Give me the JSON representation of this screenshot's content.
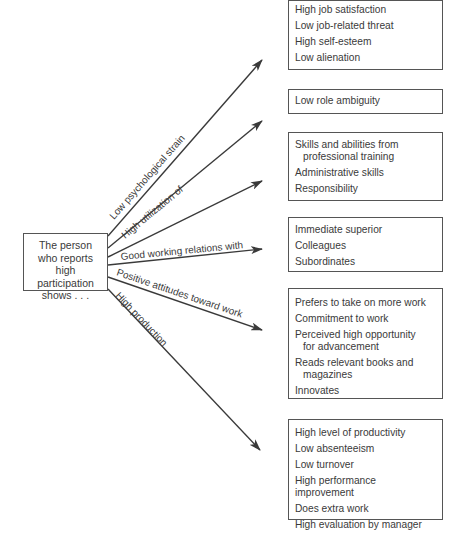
{
  "source": {
    "text": "The person who reports high participation shows . . ."
  },
  "arrows": [
    {
      "label": "Low psychological strain"
    },
    {
      "label": "High utilization of"
    },
    {
      "label": "Good working relations with"
    },
    {
      "label": "Positive attitudes toward work"
    },
    {
      "label": "High production"
    }
  ],
  "boxes": [
    {
      "items": [
        "High job satisfaction",
        "Low job-related threat",
        "High self-esteem",
        "Low alienation"
      ]
    },
    {
      "items": [
        "Low role ambiguity"
      ]
    },
    {
      "items": [
        "Skills and abilities from",
        "Administrative skills",
        "Responsibility"
      ],
      "continuation": {
        "0": "professional training"
      }
    },
    {
      "items": [
        "Immediate superior",
        "Colleagues",
        "Subordinates"
      ]
    },
    {
      "items": [
        "Prefers to take on more work",
        "Commitment to work",
        "Perceived high opportunity",
        "Reads relevant books and",
        "Innovates"
      ],
      "continuation": {
        "2": "for advancement",
        "3": "magazines"
      }
    },
    {
      "items": [
        "High level of productivity",
        "Low absenteeism",
        "Low turnover",
        "High performance improvement",
        "Does extra work",
        "High evaluation by manager"
      ]
    }
  ]
}
